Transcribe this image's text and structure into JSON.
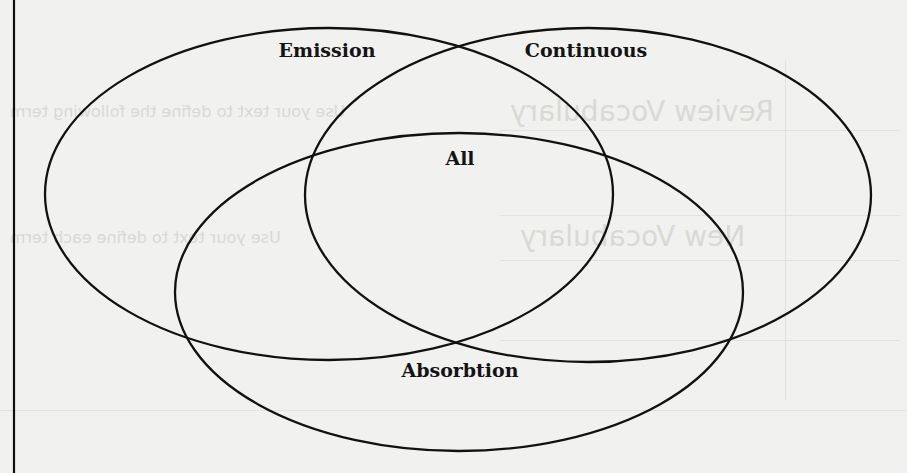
{
  "diagram": {
    "type": "venn",
    "sets": [
      {
        "id": "emission",
        "label": "Emission",
        "cx": 329,
        "cy": 194,
        "rx": 284,
        "ry": 166,
        "label_x": 327,
        "label_y": 50
      },
      {
        "id": "continuous",
        "label": "Continuous",
        "cx": 588,
        "cy": 195,
        "rx": 283,
        "ry": 167,
        "label_x": 586,
        "label_y": 50
      },
      {
        "id": "absorbtion",
        "label": "Absorbtion",
        "cx": 459,
        "cy": 292,
        "rx": 284,
        "ry": 159,
        "label_x": 460,
        "label_y": 370
      }
    ],
    "intersection_label": {
      "label": "All",
      "x": 460,
      "y": 158
    },
    "stroke_color": "#111111",
    "background_color": "#f1f1ef"
  },
  "background_bleed": {
    "row1": "Review Vocabulary",
    "row1_hint": "Use your text to define the following term",
    "row2": "New Vocabulary",
    "row2_hint": "Use your text to define each term"
  }
}
